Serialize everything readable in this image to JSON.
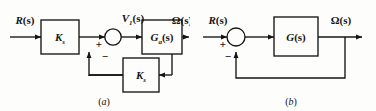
{
  "figure": {
    "background_color": "#fdfdfb",
    "line_color": "#141414",
    "text_color": "#141414"
  },
  "diagram_a": {
    "caption": "(a)",
    "caption_open": "(",
    "caption_letter": "a",
    "caption_close": ")",
    "input_signal": {
      "base": "R",
      "arg": "(s)"
    },
    "forward_gain_block": {
      "base": "K",
      "sub": "s"
    },
    "sum_output_signal": {
      "base": "V",
      "sub": "1",
      "arg": "(s)"
    },
    "plant_block": {
      "base": "G",
      "sub": "a",
      "arg": "(s)"
    },
    "output_signal": {
      "base": "Ω",
      "arg": "(s)"
    },
    "feedback_block": {
      "base": "K",
      "sub": "s"
    },
    "summing_signs": {
      "positive": "+",
      "negative": "−"
    }
  },
  "diagram_b": {
    "caption": "(b)",
    "caption_open": "(",
    "caption_letter": "b",
    "caption_close": ")",
    "input_signal": {
      "base": "R",
      "arg": "(s)"
    },
    "plant_block": {
      "base": "G",
      "arg": "(s)"
    },
    "output_signal": {
      "base": "Ω",
      "arg": "(s)"
    },
    "summing_signs": {
      "positive": "+",
      "negative": "−"
    }
  }
}
